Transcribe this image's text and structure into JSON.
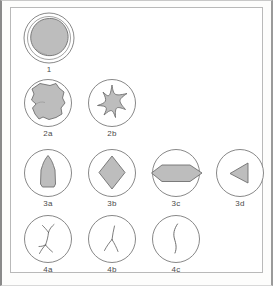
{
  "figure": {
    "title_visible": false,
    "background_color": "#ffffff",
    "frame_color": "#b9b9b9",
    "outline_color": "#6f6f6f",
    "fill_color": "#bdbdbd",
    "label_color": "#4a4a4a"
  },
  "rows": [
    {
      "row_id": "row-1",
      "items": [
        {
          "label": "1",
          "icon_name": "rounded-blob-in-double-circle-icon",
          "shape": "irregular-rounded-blob",
          "circle": "double",
          "filled": true,
          "x": 12,
          "y": 4,
          "circle_d": 52
        }
      ]
    },
    {
      "row_id": "row-2",
      "items": [
        {
          "label": "2a",
          "icon_name": "angular-blob-in-circle-icon",
          "shape": "irregular-angular-blob",
          "circle": "single",
          "filled": true,
          "x": 12,
          "y": 70,
          "circle_d": 50
        },
        {
          "label": "2b",
          "icon_name": "concave-star-in-circle-icon",
          "shape": "four-point-concave-star",
          "circle": "single",
          "filled": true,
          "x": 76,
          "y": 70,
          "circle_d": 50
        }
      ]
    },
    {
      "row_id": "row-3",
      "items": [
        {
          "label": "3a",
          "icon_name": "bottle-pentagon-in-circle-icon",
          "shape": "dome-topped-pentagon",
          "circle": "single",
          "filled": true,
          "x": 12,
          "y": 140,
          "circle_d": 50
        },
        {
          "label": "3b",
          "icon_name": "diamond-in-circle-icon",
          "shape": "rhombus-diamond",
          "circle": "single",
          "filled": true,
          "x": 76,
          "y": 140,
          "circle_d": 50
        },
        {
          "label": "3c",
          "icon_name": "elongated-hexagon-in-circle-icon",
          "shape": "horizontal-elongated-hexagon",
          "circle": "single",
          "filled": true,
          "x": 140,
          "y": 140,
          "circle_d": 50
        },
        {
          "label": "3d",
          "icon_name": "left-wedge-in-circle-icon",
          "shape": "left-pointing-triangular-wedge",
          "circle": "single",
          "filled": true,
          "x": 204,
          "y": 140,
          "circle_d": 50
        }
      ]
    },
    {
      "row_id": "row-4",
      "items": [
        {
          "label": "4a",
          "icon_name": "double-branched-line-in-circle-icon",
          "shape": "vertical-line-with-two-y-branches",
          "circle": "single",
          "filled": false,
          "x": 12,
          "y": 206,
          "circle_d": 50
        },
        {
          "label": "4b",
          "icon_name": "triple-junction-line-in-circle-icon",
          "shape": "three-pronged-y-junction",
          "circle": "single",
          "filled": false,
          "x": 76,
          "y": 206,
          "circle_d": 50
        },
        {
          "label": "4c",
          "icon_name": "single-curved-line-in-circle-icon",
          "shape": "single-sinuous-curve",
          "circle": "single",
          "filled": false,
          "x": 140,
          "y": 206,
          "circle_d": 50
        }
      ]
    }
  ]
}
